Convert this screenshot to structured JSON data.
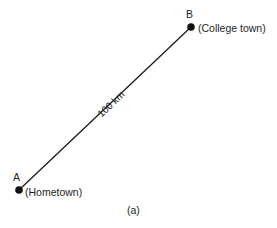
{
  "diagram": {
    "points": {
      "a": {
        "letter": "A",
        "name": "(Hometown)",
        "x": 19,
        "y": 190
      },
      "b": {
        "letter": "B",
        "name": "(College town)",
        "x": 191,
        "y": 27
      }
    },
    "segment_label": "100 km",
    "caption": "(a)",
    "colors": {
      "line": "#1a1a1a",
      "dot": "#111111",
      "text": "#1e1e1e"
    }
  }
}
